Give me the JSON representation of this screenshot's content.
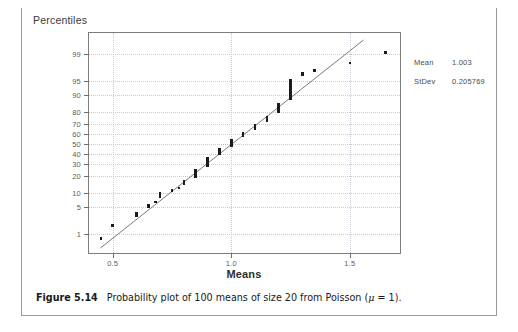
{
  "figure": {
    "number_label": "Figure 5.14",
    "caption_text": "Probability plot of 100 means of size 20 from Poisson (μ = 1)."
  },
  "legend": {
    "rows": [
      {
        "key": "Mean",
        "value": "1.003"
      },
      {
        "key": "StDev",
        "value": "0.205769"
      }
    ]
  },
  "chart_data": {
    "type": "scatter",
    "title": "",
    "xlabel": "Means",
    "ylabel": "Percentiles",
    "grid": true,
    "legend_position": "right-outside",
    "xlim": [
      0.4,
      1.72
    ],
    "ylim_percentile": [
      0.2,
      99.8
    ],
    "xticks": [
      0.5,
      1.0,
      1.5
    ],
    "xtick_labels": [
      "0.5",
      "1.0",
      "1.5"
    ],
    "yticks": [
      1,
      5,
      10,
      20,
      30,
      40,
      50,
      60,
      70,
      80,
      90,
      95,
      99
    ],
    "ytick_labels": [
      "1",
      "5",
      "10",
      "20",
      "30",
      "40",
      "50",
      "60",
      "70",
      "80",
      "90",
      "95",
      "99"
    ],
    "fit_line": {
      "mean": 1.003,
      "stdev": 0.205769
    },
    "n_points": 100,
    "points": [
      {
        "x": 0.45,
        "p": 0.7
      },
      {
        "x": 0.5,
        "p": 1.7
      },
      {
        "x": 0.6,
        "p": 2.8
      },
      {
        "x": 0.6,
        "p": 3.6
      },
      {
        "x": 0.65,
        "p": 4.6
      },
      {
        "x": 0.65,
        "p": 5.5
      },
      {
        "x": 0.68,
        "p": 6.5
      },
      {
        "x": 0.7,
        "p": 7.6
      },
      {
        "x": 0.7,
        "p": 8.8
      },
      {
        "x": 0.7,
        "p": 10.0
      },
      {
        "x": 0.75,
        "p": 11.2
      },
      {
        "x": 0.78,
        "p": 12.5
      },
      {
        "x": 0.8,
        "p": 13.8
      },
      {
        "x": 0.8,
        "p": 15.2
      },
      {
        "x": 0.8,
        "p": 16.6
      },
      {
        "x": 0.85,
        "p": 18.1
      },
      {
        "x": 0.85,
        "p": 19.6
      },
      {
        "x": 0.85,
        "p": 21.2
      },
      {
        "x": 0.85,
        "p": 22.8
      },
      {
        "x": 0.85,
        "p": 24.5
      },
      {
        "x": 0.9,
        "p": 26.2
      },
      {
        "x": 0.9,
        "p": 28.0
      },
      {
        "x": 0.9,
        "p": 29.8
      },
      {
        "x": 0.9,
        "p": 31.7
      },
      {
        "x": 0.9,
        "p": 33.6
      },
      {
        "x": 0.9,
        "p": 35.6
      },
      {
        "x": 0.95,
        "p": 37.6
      },
      {
        "x": 0.95,
        "p": 39.7
      },
      {
        "x": 0.95,
        "p": 41.8
      },
      {
        "x": 0.95,
        "p": 44.0
      },
      {
        "x": 1.0,
        "p": 46.2
      },
      {
        "x": 1.0,
        "p": 48.5
      },
      {
        "x": 1.0,
        "p": 50.8
      },
      {
        "x": 1.0,
        "p": 53.2
      },
      {
        "x": 1.05,
        "p": 55.6
      },
      {
        "x": 1.05,
        "p": 58.0
      },
      {
        "x": 1.05,
        "p": 60.5
      },
      {
        "x": 1.1,
        "p": 63.0
      },
      {
        "x": 1.1,
        "p": 65.5
      },
      {
        "x": 1.1,
        "p": 68.0
      },
      {
        "x": 1.15,
        "p": 70.5
      },
      {
        "x": 1.15,
        "p": 73.0
      },
      {
        "x": 1.15,
        "p": 75.5
      },
      {
        "x": 1.2,
        "p": 78.0
      },
      {
        "x": 1.2,
        "p": 80.4
      },
      {
        "x": 1.2,
        "p": 82.7
      },
      {
        "x": 1.2,
        "p": 84.9
      },
      {
        "x": 1.25,
        "p": 87.0
      },
      {
        "x": 1.25,
        "p": 89.0
      },
      {
        "x": 1.25,
        "p": 90.8
      },
      {
        "x": 1.25,
        "p": 92.4
      },
      {
        "x": 1.25,
        "p": 93.8
      },
      {
        "x": 1.25,
        "p": 95.0
      },
      {
        "x": 1.3,
        "p": 95.9
      },
      {
        "x": 1.3,
        "p": 96.6
      },
      {
        "x": 1.35,
        "p": 97.2
      },
      {
        "x": 1.5,
        "p": 98.2
      },
      {
        "x": 1.65,
        "p": 99.1
      }
    ],
    "clusters": [
      {
        "x": 0.45,
        "p_low": 0.7,
        "p_high": 0.7
      },
      {
        "x": 0.5,
        "p_low": 1.7,
        "p_high": 1.7
      },
      {
        "x": 0.6,
        "p_low": 2.7,
        "p_high": 3.7
      },
      {
        "x": 0.65,
        "p_low": 4.5,
        "p_high": 5.6
      },
      {
        "x": 0.68,
        "p_low": 6.4,
        "p_high": 6.6
      },
      {
        "x": 0.7,
        "p_low": 7.5,
        "p_high": 10.2
      },
      {
        "x": 0.75,
        "p_low": 11.0,
        "p_high": 11.4
      },
      {
        "x": 0.78,
        "p_low": 12.3,
        "p_high": 12.7
      },
      {
        "x": 0.8,
        "p_low": 13.6,
        "p_high": 16.8
      },
      {
        "x": 0.85,
        "p_low": 17.9,
        "p_high": 24.7
      },
      {
        "x": 0.9,
        "p_low": 26.0,
        "p_high": 35.8
      },
      {
        "x": 0.95,
        "p_low": 37.4,
        "p_high": 44.2
      },
      {
        "x": 1.0,
        "p_low": 46.0,
        "p_high": 53.4
      },
      {
        "x": 1.05,
        "p_low": 55.4,
        "p_high": 60.7
      },
      {
        "x": 1.1,
        "p_low": 62.8,
        "p_high": 68.2
      },
      {
        "x": 1.15,
        "p_low": 70.3,
        "p_high": 75.7
      },
      {
        "x": 1.2,
        "p_low": 77.8,
        "p_high": 85.1
      },
      {
        "x": 1.25,
        "p_low": 86.8,
        "p_high": 95.2
      },
      {
        "x": 1.3,
        "p_low": 95.8,
        "p_high": 96.7
      },
      {
        "x": 1.35,
        "p_low": 97.2,
        "p_high": 97.2
      },
      {
        "x": 1.5,
        "p_low": 98.2,
        "p_high": 98.2
      },
      {
        "x": 1.65,
        "p_low": 99.1,
        "p_high": 99.1
      }
    ]
  }
}
